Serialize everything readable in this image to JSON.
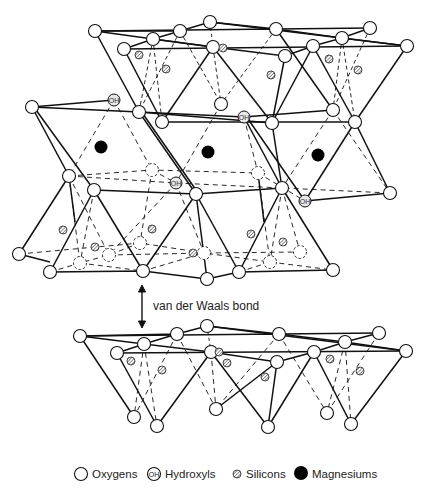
{
  "diagram": {
    "title": "",
    "annotation": {
      "van_der_waals": "van der Waals bond"
    },
    "colors": {
      "line": "#111111",
      "atom_fill": "#ffffff",
      "magnesium": "#000000",
      "silicon_hatch": "#555555",
      "background": "#ffffff"
    },
    "layers": [
      "upper tetrahedral sheet",
      "octahedral sheet",
      "lower tetrahedral sheet",
      "next layer tetrahedral sheet"
    ],
    "atom_counts_visible": {
      "magnesiums": 3,
      "hydroxyls": 4
    }
  },
  "legend": {
    "items": [
      {
        "icon": "oxygen-icon",
        "label": "Oxygens"
      },
      {
        "icon": "hydroxyl-icon",
        "label": "Hydroxyls",
        "symbol": "OH"
      },
      {
        "icon": "silicon-icon",
        "label": "Silicons"
      },
      {
        "icon": "magnesium-icon",
        "label": "Magnesiums"
      }
    ]
  },
  "hydroxyl_symbol": "OH"
}
